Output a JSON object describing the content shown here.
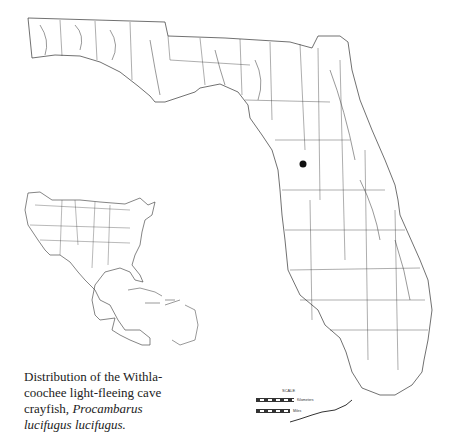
{
  "caption": {
    "line1": "Distribution of the Withla-",
    "line2": "coochee light-fleeing cave",
    "line3_plain": "crayfish, ",
    "line3_italic": "Procambarus",
    "line4_italic": "lucifugus lucifugus."
  },
  "map": {
    "region": "Florida",
    "inset": "North America (USA, Mexico, Caribbean)",
    "locality_marker": {
      "x": 303,
      "y": 164,
      "color": "#111111"
    },
    "line_color": "#333333"
  },
  "scale": {
    "title": "SCALE",
    "km_ticks": "0 10 20 30 40 50",
    "km_label": "Kilometers",
    "mi_ticks": "0 10 20 30 40",
    "mi_label": "Miles"
  }
}
